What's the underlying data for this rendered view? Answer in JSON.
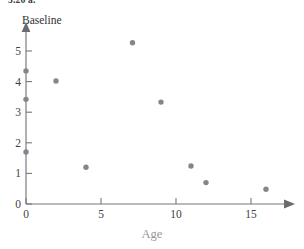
{
  "figure": {
    "caption_fragment": "5.26 a."
  },
  "chart_data": {
    "type": "scatter",
    "title": "",
    "subtitle": "",
    "xlabel": "Age",
    "ylabel": "Baseline",
    "xlim": [
      0,
      17.2
    ],
    "ylim": [
      0,
      5.62
    ],
    "xticks": [
      0,
      5,
      10,
      15
    ],
    "xtick_labels": [
      "0",
      "5",
      "10",
      "15"
    ],
    "yticks": [
      0,
      1,
      2,
      3,
      4,
      5
    ],
    "ytick_labels": [
      "0",
      "1",
      "2",
      "3",
      "4",
      "5"
    ],
    "grid": false,
    "legend": false,
    "legend_position": "none",
    "marker": "filled-circle",
    "marker_color": "#85858c",
    "axis_color": "#77777c",
    "axis_style": "arrowed-open-axes",
    "points": [
      {
        "x": 0.0,
        "y": 4.35
      },
      {
        "x": 0.0,
        "y": 3.42
      },
      {
        "x": 0.0,
        "y": 1.7
      },
      {
        "x": 2.0,
        "y": 4.02
      },
      {
        "x": 4.0,
        "y": 1.2
      },
      {
        "x": 7.1,
        "y": 5.27
      },
      {
        "x": 9.0,
        "y": 3.33
      },
      {
        "x": 11.0,
        "y": 1.24
      },
      {
        "x": 12.0,
        "y": 0.7
      },
      {
        "x": 16.0,
        "y": 0.48
      }
    ]
  }
}
